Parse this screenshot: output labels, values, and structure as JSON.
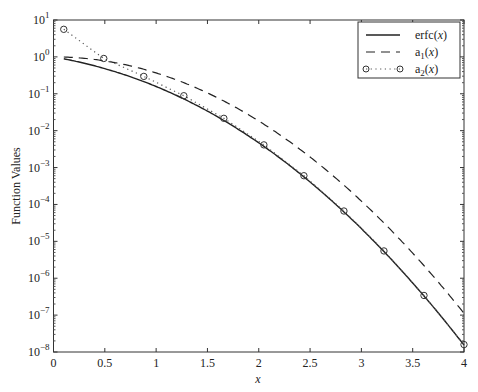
{
  "chart_data": {
    "type": "line",
    "title": "",
    "xlabel": "x",
    "ylabel": "Function Values",
    "xscale": "linear",
    "yscale": "log",
    "xlim": [
      0,
      4
    ],
    "ylim": [
      1e-08,
      10
    ],
    "x_ticks": [
      0,
      0.5,
      1,
      1.5,
      2,
      2.5,
      3,
      3.5,
      4
    ],
    "x_tick_labels": [
      "0",
      "0.5",
      "1",
      "1.5",
      "2",
      "2.5",
      "3",
      "3.5",
      "4"
    ],
    "y_ticks": [
      10.0,
      1.0,
      0.1,
      0.01,
      0.001,
      0.0001,
      1e-05,
      1e-06,
      1e-07,
      1e-08
    ],
    "y_tick_exponents": [
      "1",
      "0",
      "−1",
      "−2",
      "−3",
      "−4",
      "−5",
      "−6",
      "−7",
      "−8"
    ],
    "grid": false,
    "legend_position": "upper right",
    "x": [
      0.1,
      0.49,
      0.88,
      1.27,
      1.66,
      2.05,
      2.44,
      2.83,
      3.22,
      3.61,
      4.0
    ],
    "series": [
      {
        "name": "erfc(x)",
        "style": "solid",
        "marker": "none",
        "values": [
          0.8875,
          0.4883,
          0.2133,
          0.0723,
          0.0185,
          0.00364,
          0.000542,
          6.1e-05,
          5.2e-06,
          3.3e-07,
          1.54e-08
        ]
      },
      {
        "name": "a1(x)",
        "style": "dashed",
        "marker": "none",
        "values": [
          0.99,
          0.787,
          0.461,
          0.199,
          0.0636,
          0.015,
          0.0026,
          0.000333,
          3.13e-05,
          2.18e-06,
          1.13e-07
        ]
      },
      {
        "name": "a2(x)",
        "style": "dotted",
        "marker": "circle",
        "values": [
          5.59,
          0.906,
          0.296,
          0.0886,
          0.0216,
          0.00412,
          0.000601,
          6.64e-05,
          5.49e-06,
          3.41e-07,
          1.59e-08
        ]
      }
    ]
  },
  "legend": {
    "items": [
      {
        "prefix": "erfc(",
        "var": "x",
        "suffix": ")",
        "sub": ""
      },
      {
        "prefix": "a",
        "sub": "1",
        "mid": "(",
        "var": "x",
        "suffix": ")"
      },
      {
        "prefix": "a",
        "sub": "2",
        "mid": "(",
        "var": "x",
        "suffix": ")"
      }
    ]
  },
  "axes": {
    "xlabel": "x",
    "ylabel": "Function Values"
  }
}
